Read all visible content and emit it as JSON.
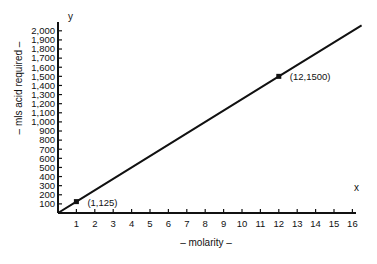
{
  "chart_data": {
    "type": "line",
    "title": "",
    "xlabel": "– molarity –",
    "ylabel": "– mls  acid  required –",
    "x_axis_letter": "x",
    "y_axis_letter": "y",
    "xlim": [
      0,
      16
    ],
    "ylim": [
      0,
      2000
    ],
    "x_ticks": [
      1,
      2,
      3,
      4,
      5,
      6,
      7,
      8,
      9,
      10,
      11,
      12,
      13,
      14,
      15,
      16
    ],
    "y_ticks": [
      100,
      200,
      300,
      400,
      500,
      600,
      700,
      800,
      900,
      1000,
      1100,
      1200,
      1300,
      1400,
      1500,
      1600,
      1700,
      1800,
      1900,
      2000
    ],
    "y_tick_labels": [
      "100",
      "200",
      "300",
      "400",
      "500",
      "600",
      "700",
      "800",
      "900",
      "1,000",
      "1,100",
      "1,200",
      "1,300",
      "1,400",
      "1,500",
      "1,600",
      "1,700",
      "1,800",
      "1,900",
      "2,000"
    ],
    "grid": false,
    "legend": null,
    "series": [
      {
        "name": "mls acid required vs molarity",
        "x": [
          0,
          1,
          12,
          16.5
        ],
        "y": [
          0,
          125,
          1500,
          2060
        ],
        "color": "#111111"
      }
    ],
    "annotations": [
      {
        "label": "(1,125)",
        "x": 1,
        "y": 125
      },
      {
        "label": "(12,1500)",
        "x": 12,
        "y": 1500
      }
    ]
  }
}
